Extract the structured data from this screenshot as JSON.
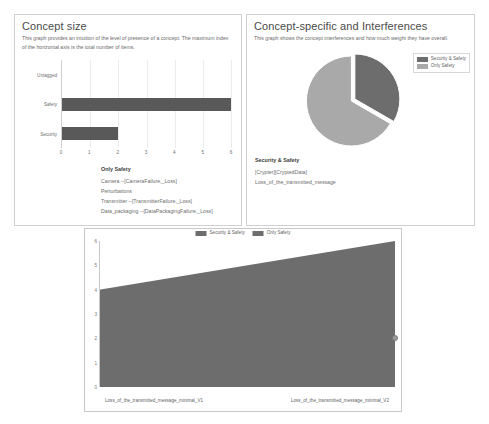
{
  "colors": {
    "dark": "#595959",
    "pie_dark": "#6d6d6d",
    "pie_light": "#a9a9a9",
    "area_dark": "#6d6d6d",
    "panel_border": "#d0d0d0",
    "text": "#6a6a6a"
  },
  "left_panel": {
    "title": "Concept size",
    "description": "This graph provides an intuition of the level of presence of a concept. The maximum index of the horizontal axis is the total number of items.",
    "list": {
      "heading": "Only Safety",
      "items": [
        "Camera --[CameraFailure,_Loss]",
        "Perturbations",
        "Transmitter --[TransmitterFailure,_Loss]",
        "Data_packaging --[DataPackagingFailure,_Loss]"
      ]
    }
  },
  "right_panel": {
    "title": "Concept-specific and Interferences",
    "description": "This graph shows the concept interferences and how much weight they have overall.",
    "list": {
      "heading": "Security & Safety",
      "items": [
        "[Crypter][CryptedData]",
        "Loss_of_the_transmitted_message"
      ]
    }
  },
  "chart_data": [
    {
      "type": "bar",
      "orientation": "horizontal",
      "title": "Concept size",
      "categories": [
        "Untagged",
        "Safety",
        "Security"
      ],
      "values": [
        0,
        6,
        2
      ],
      "xlabel": "",
      "ylabel": "",
      "xlim": [
        0,
        6
      ],
      "xticks": [
        "0",
        "1",
        "2",
        "3",
        "4",
        "5",
        "6"
      ],
      "grid": true,
      "legend": "none"
    },
    {
      "type": "pie",
      "title": "Concept-specific and Interferences",
      "labels": [
        "Security & Safety",
        "Only Safety"
      ],
      "values": [
        2,
        4
      ],
      "percentages": [
        33,
        67
      ],
      "exploded": [
        "Security & Safety"
      ],
      "legend_position": "top-right"
    },
    {
      "type": "area",
      "title": "",
      "x": [
        "Loss_of_the_transmitted_message_minimal_V1",
        "Loss_of_the_transmitted_message_minimal_V2"
      ],
      "series": [
        {
          "name": "Security & Safety",
          "values": [
            4,
            6
          ]
        },
        {
          "name": "Only Safety",
          "values": [
            0,
            0
          ]
        }
      ],
      "ylim": [
        0,
        6
      ],
      "yticks": [
        "0",
        "1",
        "2",
        "3",
        "4",
        "5",
        "6"
      ],
      "legend": [
        "Security & Safety",
        "Only Safety"
      ],
      "legend_position": "top-center",
      "xlabel": "",
      "ylabel": "",
      "grid": false,
      "marker": {
        "value": 2,
        "position": "right-edge"
      }
    }
  ]
}
